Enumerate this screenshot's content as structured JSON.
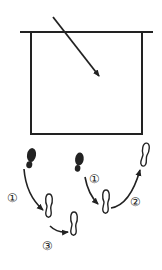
{
  "diagram": {
    "colors": {
      "stroke": "#222222",
      "background": "#ffffff"
    },
    "court": {
      "baseline": {
        "x1": 20,
        "y1": 32,
        "x2": 153,
        "y2": 32
      },
      "box": {
        "x": 31,
        "y": 32,
        "width": 111,
        "height": 102
      },
      "arrow": {
        "x1": 53,
        "y1": 17,
        "x2": 100,
        "y2": 77
      }
    },
    "left_sequence": {
      "labels": [
        "①",
        "③"
      ],
      "steps": [
        {
          "type": "filled-foot",
          "x": 30,
          "y": 150
        },
        {
          "type": "outline-foot",
          "x": 48,
          "y": 200
        },
        {
          "type": "outline-foot",
          "x": 73,
          "y": 215
        }
      ]
    },
    "right_sequence": {
      "labels": [
        "①",
        "②"
      ],
      "steps": [
        {
          "type": "filled-foot",
          "x": 78,
          "y": 157
        },
        {
          "type": "outline-foot",
          "x": 105,
          "y": 197
        },
        {
          "type": "outline-foot",
          "x": 145,
          "y": 145
        }
      ]
    },
    "step_labels": {
      "left_1": "①",
      "left_3": "③",
      "right_1": "①",
      "right_2": "②"
    }
  }
}
